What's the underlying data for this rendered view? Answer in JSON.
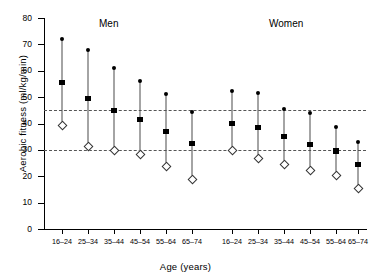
{
  "chart_data": {
    "type": "scatter",
    "title": "",
    "xlabel": "Age (years)",
    "ylabel": "Aerobic fitness (ml/kg/min)",
    "ylim": [
      0,
      80
    ],
    "yticks": [
      0,
      10,
      20,
      30,
      40,
      50,
      60,
      70,
      80
    ],
    "grid": false,
    "legend_position": "none",
    "categories": [
      "16–24",
      "25–34",
      "35–44",
      "45–54",
      "55–64",
      "65–74"
    ],
    "groups": [
      {
        "name": "Men",
        "caption": "Men"
      },
      {
        "name": "Women",
        "caption": "Women"
      }
    ],
    "reference_lines": [
      {
        "label": "upper threshold",
        "value": 45,
        "style": "dashed"
      },
      {
        "label": "lower threshold",
        "value": 30,
        "style": "dashed"
      }
    ],
    "marker_meaning": {
      "max": "filled circle (maximum)",
      "mean": "filled square (mean)",
      "min": "open diamond (minimum)"
    },
    "series": [
      {
        "name": "Men",
        "points": [
          {
            "category": "16–24",
            "max": 72,
            "mean": 55.5,
            "min": 39.5
          },
          {
            "category": "25–34",
            "max": 68,
            "mean": 49.5,
            "min": 31.5
          },
          {
            "category": "35–44",
            "max": 61,
            "mean": 45,
            "min": 30
          },
          {
            "category": "45–54",
            "max": 56,
            "mean": 41.5,
            "min": 28.5
          },
          {
            "category": "55–64",
            "max": 51,
            "mean": 37,
            "min": 24
          },
          {
            "category": "65–74",
            "max": 44.5,
            "mean": 32.5,
            "min": 19
          }
        ]
      },
      {
        "name": "Women",
        "points": [
          {
            "category": "16–24",
            "max": 52.5,
            "mean": 40,
            "min": 30
          },
          {
            "category": "25–34",
            "max": 51.5,
            "mean": 38.5,
            "min": 27
          },
          {
            "category": "35–44",
            "max": 45.5,
            "mean": 35,
            "min": 24.5
          },
          {
            "category": "45–54",
            "max": 44,
            "mean": 32,
            "min": 22.5
          },
          {
            "category": "55–64",
            "max": 38.5,
            "mean": 29.5,
            "min": 20.5
          },
          {
            "category": "65–74",
            "max": 33,
            "mean": 24.5,
            "min": 15.5
          }
        ]
      }
    ]
  },
  "axes": {
    "y_tick_labels": [
      "0",
      "10",
      "20",
      "30",
      "40",
      "50",
      "60",
      "70",
      "80"
    ],
    "x_tick_labels_men": [
      "16–24",
      "25–34",
      "35–44",
      "45–54",
      "55–64",
      "65–74"
    ],
    "x_tick_labels_women": [
      "16–24",
      "25–34",
      "35–44",
      "45–54",
      "55–64",
      "65–74"
    ],
    "x_title": "Age (years)",
    "y_title": "Aerobic fitness (ml/kg/min)"
  },
  "captions": {
    "men": "Men",
    "women": "Women"
  }
}
